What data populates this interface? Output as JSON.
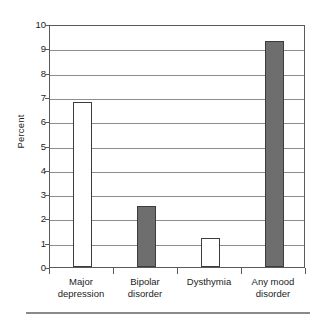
{
  "chart_data": {
    "type": "bar",
    "title": "",
    "xlabel": "",
    "ylabel": "Percent",
    "ylim": [
      0,
      10
    ],
    "ytick_step": 1,
    "grid": true,
    "legend": "none",
    "categories": [
      "Major depression",
      "Bipolar disorder",
      "Dysthymia",
      "Any mood disorder"
    ],
    "category_lines": [
      [
        "Major",
        "depression"
      ],
      [
        "Bipolar",
        "disorder"
      ],
      [
        "Dysthymia",
        ""
      ],
      [
        "Any mood",
        "disorder"
      ]
    ],
    "values": [
      6.8,
      2.5,
      1.2,
      9.3
    ],
    "bar_styles": [
      "hollow",
      "filled",
      "hollow",
      "filled"
    ],
    "ytick_labels": [
      "10",
      "9",
      "8",
      "7",
      "6",
      "5",
      "4",
      "3",
      "2",
      "1",
      "0"
    ],
    "colors": {
      "bar_fill": "#6e6e6e",
      "bar_hollow": "#ffffff",
      "bar_edge": "#3c3c3c",
      "gridline": "#8d8d8d",
      "frame": "#5a5a5a",
      "text": "#1c1c1c",
      "background": "#ffffff"
    }
  }
}
